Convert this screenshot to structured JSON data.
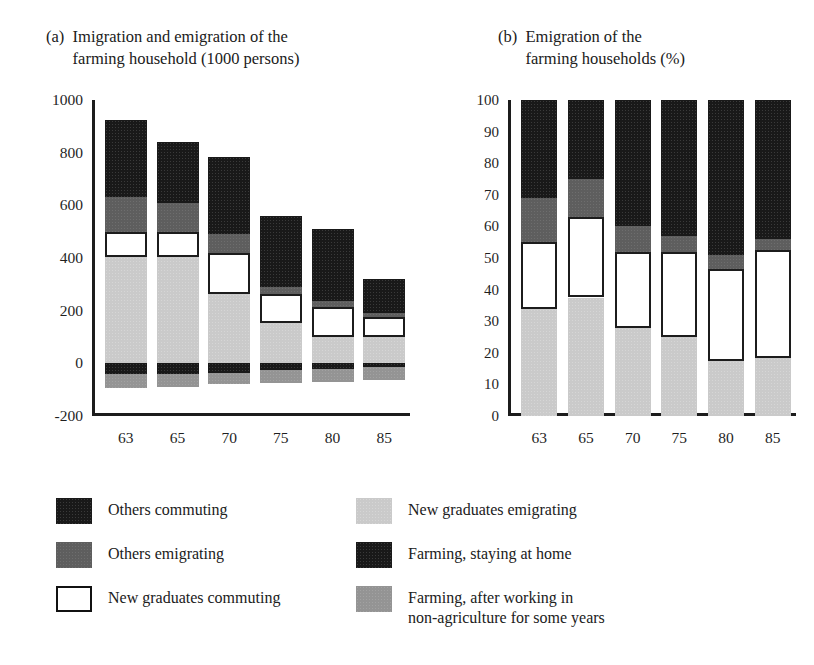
{
  "panels": {
    "a": {
      "tag": "(a)",
      "title": "Imigration and emigration of the\nfarming household (1000 persons)"
    },
    "b": {
      "tag": "(b)",
      "title": "Emigration of the\nfarming households (%)"
    }
  },
  "legend": {
    "left": [
      {
        "key": "others-commuting",
        "label": "Others commuting",
        "color": "#191919",
        "style": "solid"
      },
      {
        "key": "others-emigrating",
        "label": "Others emigrating",
        "color": "#5e5e5e",
        "style": "solid"
      },
      {
        "key": "new-graduates-commuting",
        "label": "New graduates commuting",
        "color": "#ffffff",
        "style": "outlined"
      }
    ],
    "right": [
      {
        "key": "new-graduates-emigrating",
        "label": "New graduates emigrating",
        "color": "#cacaca",
        "style": "solid"
      },
      {
        "key": "farming-staying-home",
        "label": "Farming, staying at home",
        "color": "#191919",
        "style": "solid"
      },
      {
        "key": "farming-after-nonagriculture",
        "label": "Farming, after working in\nnon-agriculture for some years",
        "color": "#949494",
        "style": "solid"
      }
    ]
  },
  "chart_data": [
    {
      "id": "panel-a",
      "type": "bar",
      "stacked": true,
      "title": "Imigration and emigration of the farming household (1000 persons)",
      "xlabel": "",
      "ylabel": "1000 persons",
      "ylim": [
        -200,
        1000
      ],
      "yticks": [
        1000,
        800,
        600,
        400,
        200,
        0,
        -200
      ],
      "grid": false,
      "legend_position": "below",
      "categories": [
        "63",
        "65",
        "70",
        "75",
        "80",
        "85"
      ],
      "series": [
        {
          "name": "Others commuting",
          "color": "#191919",
          "values": [
            295,
            230,
            295,
            270,
            275,
            130
          ]
        },
        {
          "name": "Others emigrating",
          "color": "#5e5e5e",
          "values": [
            130,
            110,
            70,
            25,
            20,
            15
          ]
        },
        {
          "name": "New graduates commuting",
          "color": "#ffffff",
          "values": [
            95,
            95,
            155,
            110,
            115,
            75
          ]
        },
        {
          "name": "New graduates emigrating",
          "color": "#cacaca",
          "values": [
            405,
            405,
            265,
            155,
            100,
            100
          ]
        },
        {
          "name": "Farming, staying at home",
          "color": "#191919",
          "values": [
            -40,
            -40,
            -35,
            -25,
            -20,
            -15
          ]
        },
        {
          "name": "Farming, after working in non-agriculture for some years",
          "color": "#949494",
          "values": [
            -55,
            -50,
            -45,
            -50,
            -50,
            -50
          ]
        }
      ],
      "bar_tops": [
        925,
        840,
        785,
        560,
        510,
        320
      ],
      "bar_bottoms": [
        -95,
        -90,
        -80,
        -75,
        -70,
        -65
      ]
    },
    {
      "id": "panel-b",
      "type": "bar",
      "stacked": true,
      "normalized": true,
      "title": "Emigration of the farming households (%)",
      "xlabel": "",
      "ylabel": "%",
      "ylim": [
        0,
        100
      ],
      "yticks": [
        100,
        90,
        80,
        70,
        60,
        50,
        40,
        30,
        20,
        10,
        0
      ],
      "grid": false,
      "legend_position": "below",
      "categories": [
        "63",
        "65",
        "70",
        "75",
        "80",
        "85"
      ],
      "series": [
        {
          "name": "New graduates emigrating",
          "color": "#cacaca",
          "values": [
            34,
            37.5,
            28,
            25,
            17.5,
            18.5
          ]
        },
        {
          "name": "New graduates commuting",
          "color": "#ffffff",
          "values": [
            21,
            25.5,
            24,
            27,
            29,
            34
          ]
        },
        {
          "name": "Others emigrating",
          "color": "#5e5e5e",
          "values": [
            14,
            12,
            8,
            5,
            4.5,
            3.5
          ]
        },
        {
          "name": "Others commuting",
          "color": "#191919",
          "values": [
            31,
            25,
            40,
            43,
            49,
            44
          ]
        }
      ],
      "cumulative_tops": [
        [
          34,
          55,
          69,
          100
        ],
        [
          37.5,
          63,
          75,
          100
        ],
        [
          28,
          52,
          60,
          100
        ],
        [
          25,
          52,
          57,
          100
        ],
        [
          17.5,
          46.5,
          51,
          100
        ],
        [
          18.5,
          52.5,
          56,
          100
        ]
      ]
    }
  ]
}
